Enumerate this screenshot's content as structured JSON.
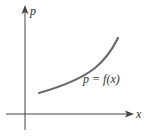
{
  "diagram": {
    "y_axis_label": "p",
    "x_axis_label": "x",
    "curve_label": "p = f(x)",
    "colors": {
      "axis": "#444444",
      "curve": "#6b6b6b",
      "text": "#333333"
    }
  }
}
